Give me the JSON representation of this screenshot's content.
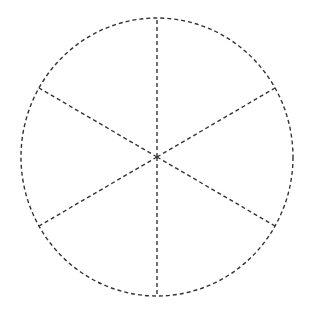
{
  "diagram": {
    "type": "divided-circle",
    "sectors": 6,
    "stroke_color": "#333333",
    "background": "#ffffff",
    "line_style": "dashed",
    "center": [
      157,
      157
    ],
    "radius_x": 136,
    "radius_y": 139,
    "spokes": [
      {
        "from": [
          157,
          157
        ],
        "to": [
          157,
          18
        ]
      },
      {
        "from": [
          157,
          157
        ],
        "to": [
          157,
          296
        ]
      },
      {
        "from": [
          157,
          157
        ],
        "to": [
          39,
          88
        ]
      },
      {
        "from": [
          157,
          157
        ],
        "to": [
          275,
          88
        ]
      },
      {
        "from": [
          157,
          157
        ],
        "to": [
          39,
          226
        ]
      },
      {
        "from": [
          157,
          157
        ],
        "to": [
          275,
          226
        ]
      }
    ]
  }
}
